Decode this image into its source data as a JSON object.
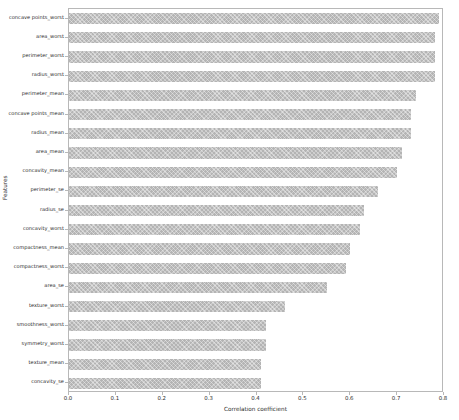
{
  "chart_data": {
    "type": "bar",
    "orientation": "horizontal",
    "title": "",
    "xlabel": "Correlation coefficient",
    "ylabel": "Features",
    "xlim": [
      0.0,
      0.8
    ],
    "xticks": [
      "0.0",
      "0.1",
      "0.2",
      "0.3",
      "0.4",
      "0.5",
      "0.6",
      "0.7",
      "0.8"
    ],
    "xtick_values": [
      0.0,
      0.1,
      0.2,
      0.3,
      0.4,
      0.5,
      0.6,
      0.7,
      0.8
    ],
    "grid": false,
    "legend": null,
    "bar_color": "#b4b4b4",
    "bar_hatch": "crosshatch",
    "categories": [
      "concave points_worst",
      "area_worst",
      "perimeter_worst",
      "radius_worst",
      "perimeter_mean",
      "concave points_mean",
      "radius_mean",
      "area_mean",
      "concavity_mean",
      "perimeter_se",
      "radius_se",
      "concavity_worst",
      "compactness_mean",
      "compactness_worst",
      "area_se",
      "texture_worst",
      "smoothness_worst",
      "symmetry_worst",
      "texture_mean",
      "concavity_se"
    ],
    "values": [
      0.79,
      0.78,
      0.78,
      0.78,
      0.74,
      0.73,
      0.73,
      0.71,
      0.7,
      0.66,
      0.63,
      0.62,
      0.6,
      0.59,
      0.55,
      0.46,
      0.42,
      0.42,
      0.41,
      0.41
    ]
  }
}
